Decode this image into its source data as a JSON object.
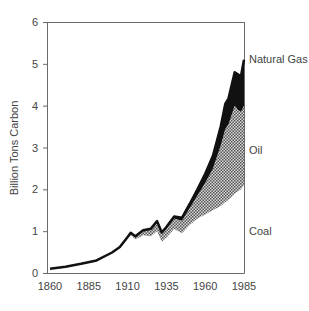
{
  "chart_data": {
    "type": "area",
    "stacked": true,
    "title": "",
    "xlabel": "",
    "ylabel": "Billion Tons Carbon",
    "xlim": [
      1860,
      1985
    ],
    "ylim": [
      0,
      6
    ],
    "x_ticks": [
      "1860",
      "1885",
      "1910",
      "1935",
      "1960",
      "1985"
    ],
    "y_ticks": [
      "0",
      "1",
      "2",
      "3",
      "4",
      "5",
      "6"
    ],
    "grid": false,
    "legend_position": "inline-right",
    "x": [
      1860,
      1870,
      1880,
      1890,
      1900,
      1905,
      1910,
      1912,
      1915,
      1920,
      1925,
      1929,
      1932,
      1935,
      1940,
      1945,
      1950,
      1955,
      1960,
      1965,
      1970,
      1973,
      1975,
      1979,
      1981,
      1983,
      1985
    ],
    "series": [
      {
        "name": "Coal",
        "fill": "none-below-curve",
        "values": [
          0.1,
          0.15,
          0.22,
          0.3,
          0.48,
          0.6,
          0.82,
          0.9,
          0.8,
          0.9,
          0.88,
          1.0,
          0.75,
          0.85,
          1.05,
          0.95,
          1.15,
          1.3,
          1.4,
          1.5,
          1.6,
          1.7,
          1.75,
          1.9,
          1.95,
          2.0,
          2.1
        ]
      },
      {
        "name": "Oil",
        "fill": "stipple",
        "values": [
          0.0,
          0.0,
          0.0,
          0.0,
          0.01,
          0.02,
          0.03,
          0.05,
          0.07,
          0.1,
          0.15,
          0.2,
          0.18,
          0.2,
          0.25,
          0.3,
          0.4,
          0.55,
          0.75,
          1.0,
          1.45,
          1.75,
          1.8,
          2.1,
          1.95,
          1.85,
          1.9
        ]
      },
      {
        "name": "Natural Gas",
        "fill": "solid-black",
        "values": [
          0.0,
          0.0,
          0.0,
          0.0,
          0.0,
          0.0,
          0.01,
          0.01,
          0.01,
          0.02,
          0.03,
          0.04,
          0.04,
          0.05,
          0.05,
          0.07,
          0.1,
          0.15,
          0.22,
          0.3,
          0.45,
          0.6,
          0.62,
          0.8,
          0.85,
          0.85,
          1.1
        ]
      }
    ],
    "annotations": [
      "Natural Gas",
      "Oil",
      "Coal"
    ]
  },
  "axis": {
    "ylabel": "Billion Tons Carbon",
    "x_ticks": [
      "1860",
      "1885",
      "1910",
      "1935",
      "1960",
      "1985"
    ],
    "y_ticks": [
      "0",
      "1",
      "2",
      "3",
      "4",
      "5",
      "6"
    ]
  },
  "labels": {
    "natural_gas": "Natural Gas",
    "oil": "Oil",
    "coal": "Coal"
  },
  "colors": {
    "axis": "#6b6b6b",
    "gas": "#111111",
    "oil_dots": "#555555",
    "text": "#444444"
  }
}
